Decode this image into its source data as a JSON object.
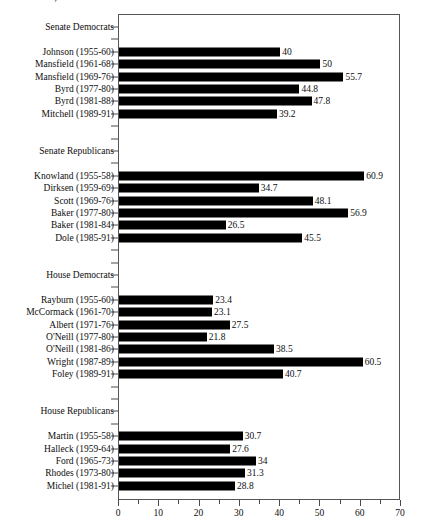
{
  "chart_data": {
    "type": "bar",
    "orientation": "horizontal",
    "title": "Leaders, 1955-1991",
    "xlabel": "",
    "ylabel": "",
    "xlim": [
      0,
      70
    ],
    "xticks": [
      0,
      10,
      20,
      30,
      40,
      50,
      60,
      70
    ],
    "xtick_labels": [
      "0",
      "10",
      "20",
      "30",
      "40",
      "50",
      "60",
      "70"
    ],
    "minor_tick_step": 5,
    "grid": false,
    "legend": null,
    "bar_color": "#000000",
    "frame_color": "#555555",
    "groups": [
      {
        "name": "Senate Democrats",
        "categories": [
          "Johnson (1955-60)",
          "Mansfield (1961-68)",
          "Mansfield (1969-76)",
          "Byrd (1977-80)",
          "Byrd (1981-88)",
          "Mitchell (1989-91)"
        ],
        "values": [
          40,
          50,
          55.7,
          44.8,
          47.8,
          39.2
        ],
        "value_labels": [
          "40",
          "50",
          "55.7",
          "44.8",
          "47.8",
          "39.2"
        ]
      },
      {
        "name": "Senate Republicans",
        "categories": [
          "Knowland (1955-58)",
          "Dirksen (1959-69)",
          "Scott (1969-76)",
          "Baker (1977-80)",
          "Baker (1981-84)",
          "Dole (1985-91)"
        ],
        "values": [
          60.9,
          34.7,
          48.1,
          56.9,
          26.5,
          45.5
        ],
        "value_labels": [
          "60.9",
          "34.7",
          "48.1",
          "56.9",
          "26.5",
          "45.5"
        ]
      },
      {
        "name": "House Democrats",
        "categories": [
          "Rayburn (1955-60)",
          "McCormack (1961-70)",
          "Albert (1971-76)",
          "O'Neill (1977-80)",
          "O'Neill (1981-86)",
          "Wright (1987-89)",
          "Foley (1989-91)"
        ],
        "values": [
          23.4,
          23.1,
          27.5,
          21.8,
          38.5,
          60.5,
          40.7
        ],
        "value_labels": [
          "23.4",
          "23.1",
          "27.5",
          "21.8",
          "38.5",
          "60.5",
          "40.7"
        ]
      },
      {
        "name": "House Republicans",
        "categories": [
          "Martin (1955-58)",
          "Halleck (1959-64)",
          "Ford (1965-73)",
          "Rhodes (1973-80)",
          "Michel (1981-91)"
        ],
        "values": [
          30.7,
          27.6,
          34,
          31.3,
          28.8
        ],
        "value_labels": [
          "30.7",
          "27.6",
          "34",
          "31.3",
          "28.8"
        ]
      }
    ]
  }
}
